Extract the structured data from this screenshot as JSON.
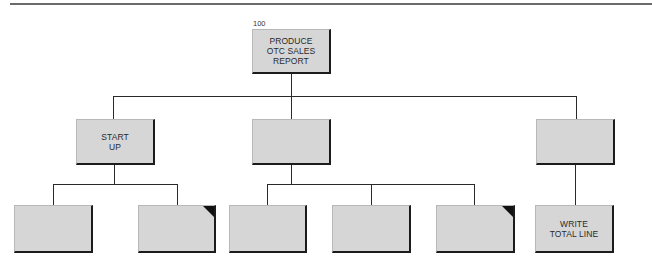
{
  "diagram": {
    "type": "structure-chart",
    "root": {
      "number": "100",
      "label": "PRODUCE\nOTC SALES\nREPORT"
    },
    "level2": [
      {
        "label": "START\nUP"
      },
      {
        "label": ""
      },
      {
        "label": ""
      }
    ],
    "level3": [
      {
        "label": "",
        "parent": 0,
        "marked": false
      },
      {
        "label": "",
        "parent": 0,
        "marked": true
      },
      {
        "label": "",
        "parent": 1,
        "marked": false
      },
      {
        "label": "",
        "parent": 1,
        "marked": false
      },
      {
        "label": "",
        "parent": 1,
        "marked": true
      },
      {
        "label": "WRITE\nTOTAL LINE",
        "parent": 2,
        "marked": false
      }
    ],
    "colors": {
      "box_fill": "#d6d6d6",
      "line": "#2a2a2a",
      "corner_mark": "#111111"
    }
  }
}
